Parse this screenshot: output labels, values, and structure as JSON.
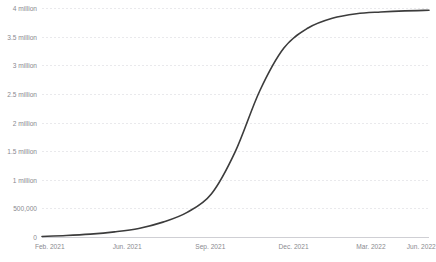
{
  "chart_data": {
    "type": "line",
    "title": "",
    "subtitle": "",
    "xlabel": "",
    "ylabel": "",
    "grid": true,
    "legend": false,
    "legend_position": "none",
    "line_color": "#3c3c3c",
    "grid_color": "#e9e9ec",
    "axis_color": "#cfcfd4",
    "tick_label_color": "#8a8a90",
    "background_color": "#ffffff",
    "ylim": [
      0,
      4000000
    ],
    "ytick_values": [
      0,
      500000,
      1000000,
      1500000,
      2000000,
      2500000,
      3000000,
      3500000,
      4000000
    ],
    "ytick_labels": [
      "0",
      "500,000",
      "1 million",
      "1.5 million",
      "2 million",
      "2.5 million",
      "3 million",
      "3.5 million",
      "4 million"
    ],
    "xtick_labels": [
      "Feb. 2021",
      "Jun. 2021",
      "Sep. 2021",
      "Dec. 2021",
      "Mar. 2022",
      "Jun. 2022"
    ],
    "xtick_positions_pct": [
      2.0,
      22.0,
      43.5,
      65.0,
      85.0,
      98.0
    ],
    "x": [
      "Feb. 2021",
      "Mar. 2021",
      "Apr. 2021",
      "May 2021",
      "Jun. 2021",
      "Jul. 2021",
      "Aug. 2021",
      "Sep. 2021",
      "Oct. 2021",
      "Nov. 2021",
      "Dec. 2021",
      "Jan. 2022",
      "Feb. 2022",
      "Mar. 2022",
      "Apr. 2022",
      "May 2022",
      "Jun. 2022"
    ],
    "values": [
      10000,
      25000,
      50000,
      90000,
      150000,
      260000,
      430000,
      750000,
      1500000,
      2550000,
      3300000,
      3650000,
      3820000,
      3900000,
      3930000,
      3950000,
      3960000
    ],
    "series": [
      {
        "name": "cumulative total",
        "color": "#3c3c3c",
        "values": [
          10000,
          25000,
          50000,
          90000,
          150000,
          260000,
          430000,
          750000,
          1500000,
          2550000,
          3300000,
          3650000,
          3820000,
          3900000,
          3930000,
          3950000,
          3960000
        ]
      }
    ],
    "annotations": []
  },
  "watermark": {
    "text": ""
  }
}
